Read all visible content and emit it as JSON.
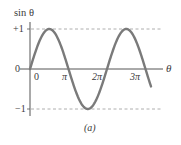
{
  "chart_data": {
    "type": "line",
    "title": "",
    "caption": "(a)",
    "xlabel": "θ",
    "ylabel": "sin θ",
    "function": "sin(θ)",
    "x_range_rad": [
      0,
      3.3
    ],
    "x_range_note": "curve runs from 0 slightly past 3π",
    "ylim": [
      -1,
      1
    ],
    "x_ticks": [
      {
        "value": 0,
        "label": "0"
      },
      {
        "value": 3.14159,
        "label": "π"
      },
      {
        "value": 6.28319,
        "label": "2π"
      },
      {
        "value": 9.42478,
        "label": "3π"
      }
    ],
    "y_ticks": [
      {
        "value": 1,
        "label": "+1"
      },
      {
        "value": 0,
        "label": "0"
      },
      {
        "value": -1,
        "label": "−1"
      }
    ],
    "reference_lines": [
      {
        "y": 1,
        "style": "dashed"
      },
      {
        "y": -1,
        "style": "dashed"
      }
    ],
    "key_points": [
      {
        "theta": "0",
        "value": 0
      },
      {
        "theta": "π/2",
        "value": 1
      },
      {
        "theta": "π",
        "value": 0
      },
      {
        "theta": "3π/2",
        "value": -1
      },
      {
        "theta": "2π",
        "value": 0
      },
      {
        "theta": "5π/2",
        "value": 1
      },
      {
        "theta": "3π",
        "value": 0
      }
    ],
    "grid": false,
    "legend": null,
    "colors": {
      "curve": "#7a7a7a",
      "axes": "#555555",
      "dashed": "#9a9a9a",
      "text": "#3a3a3a"
    }
  },
  "labels": {
    "ylabel": "sin θ",
    "xlabel": "θ",
    "y_plus1": "+1",
    "y_zero": "0",
    "y_minus1": "−1",
    "x_zero": "0",
    "x_pi": "π",
    "x_2pi": "2π",
    "x_3pi": "3π",
    "caption": "(a)"
  }
}
